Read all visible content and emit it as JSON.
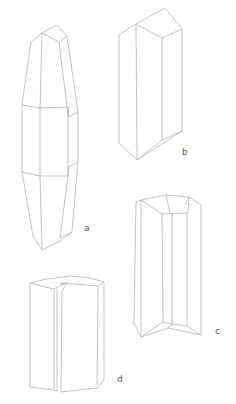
{
  "figure": {
    "line_color": "#b4b4b4",
    "label_color": "#555555",
    "crystals": [
      {
        "id": "a",
        "label": "a",
        "habit": "elongated double-terminated prism, tapered ends"
      },
      {
        "id": "b",
        "label": "b",
        "habit": "prismatic crystal with oblique termination"
      },
      {
        "id": "c",
        "label": "c",
        "habit": "prism with beveled (truncated) top and bottom"
      },
      {
        "id": "d",
        "label": "d",
        "habit": "twinned / split prismatic crystal"
      }
    ]
  }
}
